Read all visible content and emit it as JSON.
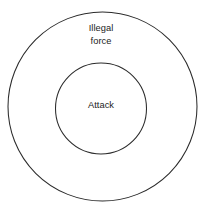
{
  "diagram": {
    "type": "concentric-circles",
    "background_color": "#ffffff",
    "stroke_color": "#2b2b2b",
    "text_color": "#232323",
    "width": 206,
    "height": 211,
    "rings": [
      {
        "id": "outer",
        "label": "Illegal\nforce",
        "label_line_1": "Illegal",
        "label_line_2": "force",
        "center_x": 102.5,
        "center_y": 106.5,
        "radius": 94.5
      },
      {
        "id": "inner",
        "label": "Attack",
        "center_x": 101,
        "center_y": 108.5,
        "radius": 45.5
      }
    ]
  }
}
